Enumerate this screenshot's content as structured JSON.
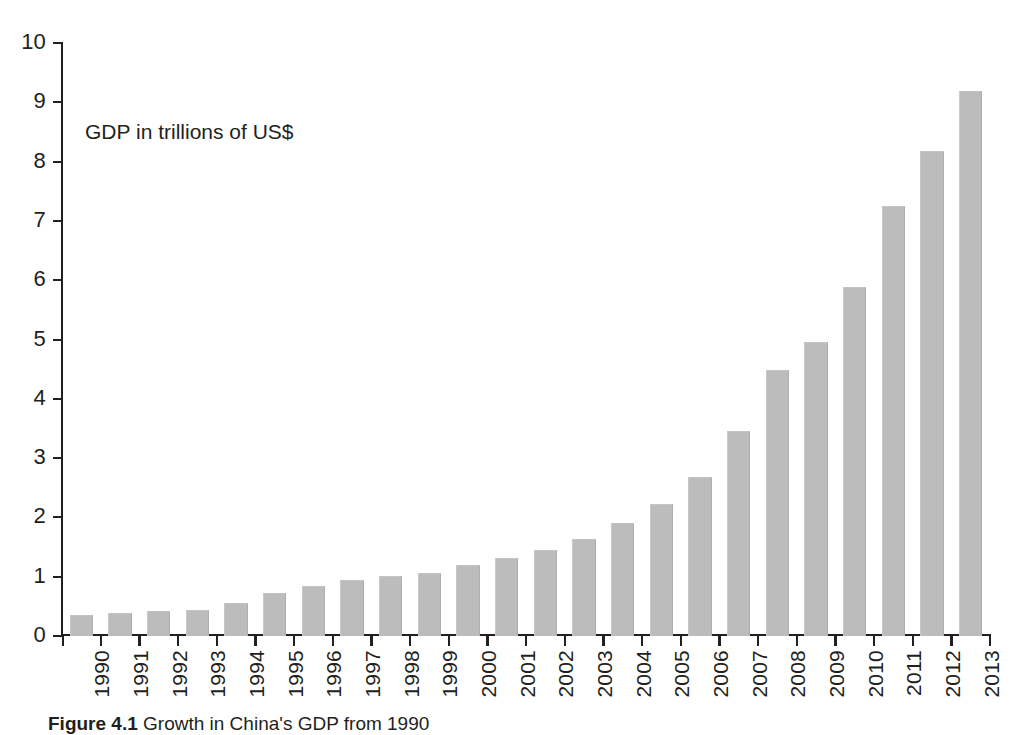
{
  "figure": {
    "caption_label": "Figure 4.1",
    "caption_text": "Growth in China's GDP from 1990",
    "annotation": "GDP in trillions of US$"
  },
  "axes": {
    "y_tick_labels": [
      "10",
      "9",
      "8",
      "7",
      "6",
      "5",
      "4",
      "3",
      "2",
      "1",
      "0"
    ],
    "x_tick_labels": [
      "1990",
      "1991",
      "1992",
      "1993",
      "1994",
      "1995",
      "1996",
      "1997",
      "1998",
      "1999",
      "2000",
      "2001",
      "2002",
      "2003",
      "2004",
      "2005",
      "2006",
      "2007",
      "2008",
      "2009",
      "2010",
      "2011",
      "2012",
      "2013"
    ]
  },
  "style": {
    "bar_color": "#bcbcbc",
    "axis_color": "#231f20",
    "text_color": "#231f20",
    "background": "#ffffff"
  },
  "chart_data": {
    "type": "bar",
    "title": "",
    "subtitle": "",
    "annotation": "GDP in trillions of US$",
    "xlabel": "",
    "ylabel": "",
    "ylim": [
      0,
      10
    ],
    "ytick_step": 1,
    "grid": false,
    "legend": false,
    "categories": [
      "1990",
      "1991",
      "1992",
      "1993",
      "1994",
      "1995",
      "1996",
      "1997",
      "1998",
      "1999",
      "2000",
      "2001",
      "2002",
      "2003",
      "2004",
      "2005",
      "2006",
      "2007",
      "2008",
      "2009",
      "2010",
      "2011",
      "2012",
      "2013"
    ],
    "values": [
      0.36,
      0.38,
      0.42,
      0.44,
      0.56,
      0.73,
      0.85,
      0.95,
      1.02,
      1.07,
      1.19,
      1.31,
      1.45,
      1.63,
      1.9,
      2.22,
      2.68,
      3.45,
      4.48,
      4.96,
      5.88,
      7.25,
      8.18,
      9.19
    ],
    "units": "trillions of US$",
    "series": [
      {
        "name": "GDP in trillions of US$",
        "values": [
          0.36,
          0.38,
          0.42,
          0.44,
          0.56,
          0.73,
          0.85,
          0.95,
          1.02,
          1.07,
          1.19,
          1.31,
          1.45,
          1.63,
          1.9,
          2.22,
          2.68,
          3.45,
          4.48,
          4.96,
          5.88,
          7.25,
          8.18,
          9.19
        ]
      }
    ]
  }
}
